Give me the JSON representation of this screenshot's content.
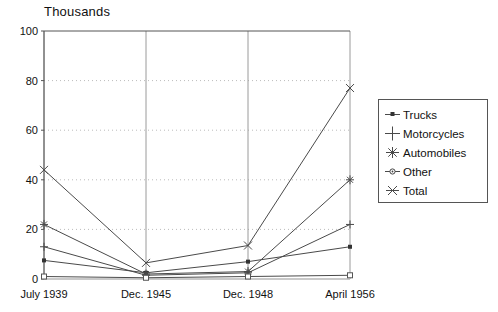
{
  "chart_data": {
    "type": "line",
    "title": "Thousands",
    "xlabel": "",
    "ylabel": "",
    "ylim": [
      0,
      100
    ],
    "yticks": [
      0,
      20,
      40,
      60,
      80,
      100
    ],
    "grid": "horizontal dotted at 20/40/60/80, vertical solid at each category",
    "legend_position": "right",
    "categories": [
      "July 1939",
      "Dec. 1945",
      "Dec. 1948",
      "April 1956"
    ],
    "series": [
      {
        "name": "Trucks",
        "marker": "square-filled",
        "values": [
          7.5,
          2.5,
          7.0,
          13.0
        ]
      },
      {
        "name": "Motorcycles",
        "marker": "plus",
        "values": [
          13.0,
          1.5,
          2.5,
          22.0
        ]
      },
      {
        "name": "Automobiles",
        "marker": "asterisk",
        "values": [
          22.0,
          2.0,
          3.0,
          40.0
        ]
      },
      {
        "name": "Other",
        "marker": "circle-dot",
        "values": [
          1.0,
          0.5,
          1.0,
          1.5
        ]
      },
      {
        "name": "Total",
        "marker": "cross",
        "values": [
          44.0,
          6.5,
          13.5,
          77.0
        ]
      }
    ]
  },
  "axis": {
    "y_labels": [
      "100",
      "80",
      "60",
      "40",
      "20",
      "0"
    ],
    "x_labels": [
      "July 1939",
      "Dec. 1945",
      "Dec. 1948",
      "April 1956"
    ]
  },
  "legend": {
    "items": [
      {
        "label": "Trucks"
      },
      {
        "label": "Motorcycles"
      },
      {
        "label": "Automobiles"
      },
      {
        "label": "Other"
      },
      {
        "label": "Total"
      }
    ]
  },
  "colors": {
    "line": "#4a4a4a",
    "axis": "#555555",
    "grid_dotted": "#bbbbbb",
    "grid_solid": "#9a9a9a",
    "text": "#111111",
    "background": "#ffffff"
  }
}
